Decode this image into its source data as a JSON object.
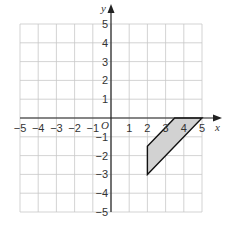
{
  "chart_data": {
    "type": "diagram",
    "title": "",
    "xlabel": "x",
    "ylabel": "y",
    "xlim": [
      -5,
      5
    ],
    "ylim": [
      -5,
      5
    ],
    "grid": true,
    "origin_label": "O",
    "x_ticks": [
      -5,
      -4,
      -3,
      -2,
      -1,
      1,
      2,
      3,
      4,
      5
    ],
    "y_ticks": [
      5,
      4,
      3,
      2,
      1,
      -1,
      -2,
      -3,
      -4,
      -5
    ],
    "shapes": [
      {
        "name": "parallelogram",
        "fill": "#d2d2d2",
        "stroke": "#111111",
        "vertices": [
          [
            2,
            -1.5
          ],
          [
            3.5,
            0
          ],
          [
            5,
            0
          ],
          [
            2,
            -3
          ]
        ]
      }
    ]
  },
  "labels": {
    "x_axis": "x",
    "y_axis": "y",
    "origin": "O",
    "x_ticks": [
      "−5",
      "−4",
      "−3",
      "−2",
      "−1",
      "1",
      "2",
      "3",
      "4",
      "5"
    ],
    "y_ticks": [
      "5",
      "4",
      "3",
      "2",
      "1",
      "−1",
      "−2",
      "−3",
      "−4",
      "−5"
    ]
  }
}
